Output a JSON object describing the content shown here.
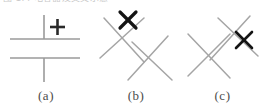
{
  "figure": {
    "clipped_header_text": "图 1.4 电容器及交叉示意",
    "background_color": "#ffffff",
    "line_color": "#9a9a9a",
    "mark_color": "#1a1a1a",
    "label_color": "#4c4c4c",
    "panels": [
      {
        "id": "a",
        "label": "(a)",
        "caption_text": "(a)",
        "symbol_name": "capacitor-with-plus",
        "elements": [
          {
            "name": "top-lead",
            "kind": "line",
            "x1": 44,
            "y1": 9,
            "x2": 44,
            "y2": 33
          },
          {
            "name": "upper-plate",
            "kind": "line",
            "x1": 10,
            "y1": 33,
            "x2": 80,
            "y2": 33
          },
          {
            "name": "plus-mark",
            "kind": "plus",
            "cx": 57,
            "cy": 21,
            "size": 15
          },
          {
            "name": "lower-plate",
            "kind": "line",
            "x1": 10,
            "y1": 52,
            "x2": 80,
            "y2": 52
          },
          {
            "name": "bottom-lead",
            "kind": "line",
            "x1": 44,
            "y1": 52,
            "x2": 44,
            "y2": 76
          }
        ]
      },
      {
        "id": "b",
        "label": "(b)",
        "caption_text": "(b)",
        "symbol_name": "crossing-lines-mark-upper-left",
        "elements": [
          {
            "name": "stroke-upper-left-to-lower-right",
            "kind": "line",
            "x1": 12,
            "y1": 12,
            "x2": 52,
            "y2": 56
          },
          {
            "name": "stroke-upper-right-to-lower-left",
            "kind": "line",
            "x1": 52,
            "y1": 12,
            "x2": 8,
            "y2": 52
          },
          {
            "name": "stroke-mid-right-descending",
            "kind": "line",
            "x1": 76,
            "y1": 30,
            "x2": 36,
            "y2": 74
          },
          {
            "name": "stroke-mid-left-ascending",
            "kind": "line",
            "x1": 40,
            "y1": 36,
            "x2": 80,
            "y2": 74
          },
          {
            "name": "x-mark",
            "kind": "xmark",
            "cx": 36,
            "cy": 14,
            "size": 17
          }
        ]
      },
      {
        "id": "c",
        "label": "(c)",
        "caption_text": "(c)",
        "symbol_name": "crossing-lines-mark-right",
        "elements": [
          {
            "name": "stroke-upper-left-to-lower-right",
            "kind": "line",
            "x1": 8,
            "y1": 28,
            "x2": 50,
            "y2": 72
          },
          {
            "name": "stroke-upper-right-to-lower-left",
            "kind": "line",
            "x1": 50,
            "y1": 28,
            "x2": 8,
            "y2": 70
          },
          {
            "name": "stroke-mid-right-descending",
            "kind": "line",
            "x1": 70,
            "y1": 10,
            "x2": 30,
            "y2": 54
          },
          {
            "name": "stroke-mid-left-ascending",
            "kind": "line",
            "x1": 38,
            "y1": 12,
            "x2": 78,
            "y2": 50
          },
          {
            "name": "x-mark",
            "kind": "xmark",
            "cx": 64,
            "cy": 34,
            "size": 17
          }
        ]
      }
    ]
  }
}
